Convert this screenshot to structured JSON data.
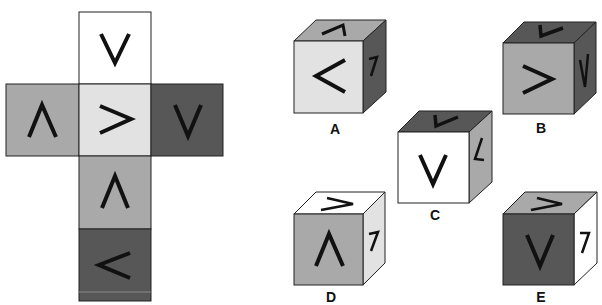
{
  "colors": {
    "white": "#ffffff",
    "light": "#e2e2e2",
    "medium": "#a9a9a9",
    "dark": "#575757",
    "stroke": "#222222",
    "symbol": "#111111"
  },
  "net": {
    "faces": [
      {
        "id": "top",
        "symbol": "V",
        "shade": "white",
        "x": 79,
        "y": 12
      },
      {
        "id": "left",
        "symbol": "Λ",
        "shade": "medium",
        "x": 6,
        "y": 84
      },
      {
        "id": "center",
        "symbol": ">",
        "shade": "light",
        "x": 79,
        "y": 84
      },
      {
        "id": "right",
        "symbol": "V",
        "shade": "dark",
        "x": 151,
        "y": 84
      },
      {
        "id": "below",
        "symbol": "Λ",
        "shade": "medium",
        "x": 79,
        "y": 156
      },
      {
        "id": "bottom",
        "symbol": "<",
        "shade": "dark",
        "x": 79,
        "y": 229
      }
    ]
  },
  "options": [
    {
      "label": "A",
      "front": {
        "symbol": "<",
        "shade": "light"
      },
      "top": {
        "symbol": "Λ",
        "shade": "medium"
      },
      "side": {
        "symbol": "7",
        "shade": "dark"
      }
    },
    {
      "label": "B",
      "front": {
        "symbol": ">",
        "shade": "medium"
      },
      "top": {
        "symbol": "V",
        "shade": "dark"
      },
      "side": {
        "symbol": "V",
        "shade": "dark"
      }
    },
    {
      "label": "C",
      "front": {
        "symbol": "V",
        "shade": "white"
      },
      "top": {
        "symbol": "V",
        "shade": "dark"
      },
      "side": {
        "symbol": "<",
        "shade": "medium"
      }
    },
    {
      "label": "D",
      "front": {
        "symbol": "Λ",
        "shade": "medium"
      },
      "top": {
        "symbol": ">",
        "shade": "white"
      },
      "side": {
        "symbol": "7",
        "shade": "light"
      }
    },
    {
      "label": "E",
      "front": {
        "symbol": "V",
        "shade": "dark"
      },
      "top": {
        "symbol": ">",
        "shade": "medium"
      },
      "side": {
        "symbol": "7",
        "shade": "white"
      }
    }
  ]
}
